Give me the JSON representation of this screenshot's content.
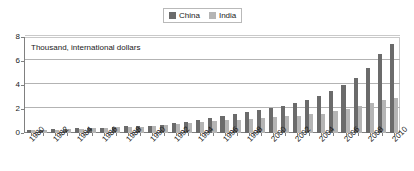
{
  "legend": {
    "entries": [
      {
        "label": "China",
        "color": "#6b6b6b",
        "icon": "legend-swatch-square"
      },
      {
        "label": "India",
        "color": "#b5b5b5",
        "icon": "legend-swatch-square"
      }
    ]
  },
  "annotation": {
    "axis_note": "Thousand, international dollars"
  },
  "chart_data": {
    "type": "bar",
    "title": "",
    "subtitle": "",
    "xlabel": "",
    "ylabel": "Thousand, international dollars",
    "ylim": [
      0,
      8
    ],
    "yticks": [
      0,
      2,
      4,
      6,
      8
    ],
    "ytick_labels": [
      "0",
      "2",
      "4",
      "6",
      "8"
    ],
    "grid": true,
    "legend_position": "top-center",
    "categories": [
      "1980",
      "1981",
      "1982",
      "1983",
      "1984",
      "1985",
      "1986",
      "1987",
      "1988",
      "1989",
      "1990",
      "1991",
      "1992",
      "1993",
      "1994",
      "1995",
      "1996",
      "1997",
      "1998",
      "1999",
      "2000",
      "2001",
      "2002",
      "2003",
      "2004",
      "2005",
      "2006",
      "2007",
      "2008",
      "2009",
      "2010"
    ],
    "xtick_labels_shown": [
      "1980",
      "1982",
      "1984",
      "1986",
      "1988",
      "1990",
      "1992",
      "1994",
      "1996",
      "1998",
      "2000",
      "2002",
      "2004",
      "2006",
      "2008",
      "2010"
    ],
    "series": [
      {
        "name": "China",
        "color": "#6b6b6b",
        "values": [
          0.25,
          0.27,
          0.3,
          0.33,
          0.38,
          0.42,
          0.45,
          0.5,
          0.55,
          0.57,
          0.6,
          0.66,
          0.75,
          0.85,
          0.96,
          1.08,
          1.2,
          1.32,
          1.42,
          1.54,
          1.7,
          1.85,
          2.05,
          2.3,
          2.62,
          3.0,
          3.48,
          4.0,
          4.62,
          5.4,
          6.05
        ]
      },
      {
        "name": "India",
        "color": "#b5b5b5",
        "values": [
          0.18,
          0.19,
          0.2,
          0.22,
          0.24,
          0.26,
          0.27,
          0.29,
          0.32,
          0.34,
          0.36,
          0.37,
          0.39,
          0.41,
          0.44,
          0.48,
          0.52,
          0.54,
          0.58,
          0.62,
          0.65,
          0.68,
          0.72,
          0.78,
          0.86,
          0.94,
          1.04,
          1.14,
          1.2,
          1.32,
          1.48
        ]
      }
    ],
    "series_display": [
      {
        "name": "China",
        "color": "#6b6b6b",
        "values": [
          0.25,
          0.27,
          0.3,
          0.33,
          0.38,
          0.42,
          0.45,
          0.5,
          0.55,
          0.57,
          0.62,
          0.7,
          0.8,
          0.92,
          1.1,
          1.25,
          1.42,
          1.58,
          1.75,
          1.92,
          2.05,
          2.25,
          2.48,
          2.75,
          3.08,
          3.48,
          3.98,
          4.62,
          5.4,
          6.62,
          7.4
        ]
      },
      {
        "name": "India",
        "color": "#b5b5b5",
        "values": [
          0.22,
          0.22,
          0.26,
          0.3,
          0.34,
          0.38,
          0.42,
          0.46,
          0.5,
          0.54,
          0.62,
          0.66,
          0.72,
          0.8,
          0.88,
          0.98,
          1.06,
          1.12,
          1.2,
          1.28,
          1.32,
          1.38,
          1.44,
          1.55,
          1.62,
          1.82,
          1.98,
          2.22,
          2.52,
          2.72,
          2.88
        ]
      }
    ]
  }
}
